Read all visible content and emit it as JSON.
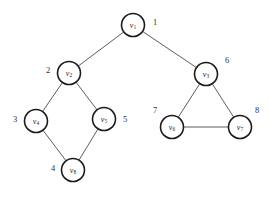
{
  "figure": {
    "background_color": "#ffffff",
    "node_fill": "#ffffff",
    "node_stroke": "#1b1b1b",
    "edge_color": "#4a4a4a",
    "label_color": "#333333",
    "width": 270,
    "height": 197,
    "node_radius": 11.5
  },
  "chart_data": {
    "type": "diagram",
    "title": "",
    "nodes": [
      {
        "id": "v1",
        "label": "v",
        "subscript": "1",
        "index_label": "1",
        "x": 133,
        "y": 25,
        "index_x": 155,
        "index_y": 22
      },
      {
        "id": "v2",
        "label": "v",
        "subscript": "2",
        "index_label": "2",
        "x": 69,
        "y": 73,
        "index_x": 48,
        "index_y": 70
      },
      {
        "id": "v3",
        "label": "v",
        "subscript": "3",
        "index_label": "6",
        "x": 206,
        "y": 74,
        "index_x": 227,
        "index_y": 60
      },
      {
        "id": "v4",
        "label": "v",
        "subscript": "4",
        "index_label": "3",
        "x": 36,
        "y": 121,
        "index_x": 15,
        "index_y": 119
      },
      {
        "id": "v5",
        "label": "v",
        "subscript": "5",
        "index_label": "5",
        "x": 104,
        "y": 119,
        "index_x": 125,
        "index_y": 119
      },
      {
        "id": "v6",
        "label": "v",
        "subscript": "6",
        "index_label": "7",
        "x": 172,
        "y": 127,
        "index_x": 155,
        "index_y": 110
      },
      {
        "id": "v7",
        "label": "v",
        "subscript": "7",
        "index_label": "8",
        "x": 240,
        "y": 127,
        "index_x": 257,
        "index_y": 110
      },
      {
        "id": "v8",
        "label": "v",
        "subscript": "8",
        "index_label": "4",
        "x": 73,
        "y": 170,
        "index_x": 53,
        "index_y": 168
      }
    ],
    "edges": [
      {
        "from": "v1",
        "to": "v2"
      },
      {
        "from": "v1",
        "to": "v3"
      },
      {
        "from": "v2",
        "to": "v4"
      },
      {
        "from": "v2",
        "to": "v5"
      },
      {
        "from": "v4",
        "to": "v8"
      },
      {
        "from": "v5",
        "to": "v8"
      },
      {
        "from": "v3",
        "to": "v6"
      },
      {
        "from": "v3",
        "to": "v7"
      },
      {
        "from": "v6",
        "to": "v7"
      }
    ]
  }
}
